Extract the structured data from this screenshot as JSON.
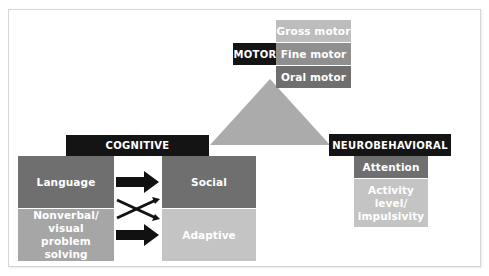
{
  "diagram": {
    "motor": {
      "header": "MOTOR",
      "items": [
        "Gross motor",
        "Fine motor",
        "Oral motor"
      ]
    },
    "cognitive": {
      "header": "COGNITIVE",
      "left": [
        "Language",
        "Nonverbal/ visual problem solving"
      ],
      "right": [
        "Social",
        "Adaptive"
      ]
    },
    "neurobehavioral": {
      "header": "NEUROBEHAVIORAL",
      "items": [
        "Attention",
        "Activity level/ impulsivity"
      ]
    },
    "colors": {
      "header_bg": "#141414",
      "dark_gray": "#6f6f6f",
      "mid_gray": "#8f8f8f",
      "light_gray": "#a6a6a6",
      "triangle": "#ababab"
    }
  }
}
